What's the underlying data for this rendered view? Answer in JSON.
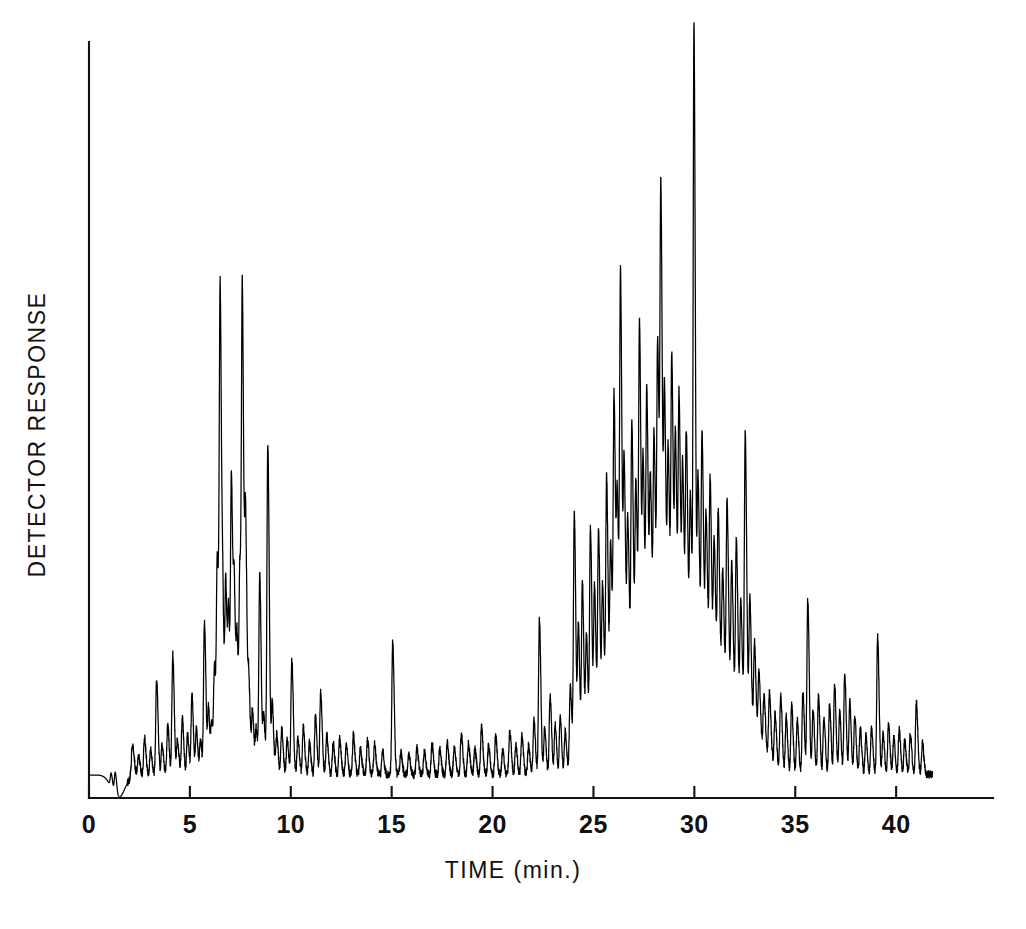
{
  "figure": {
    "background_color": "#ffffff",
    "ink_color": "#000000"
  },
  "axes": {
    "x_title": "TIME (min.)",
    "y_title": "DETECTOR  RESPONSE",
    "x_ticks": [
      "0",
      "5",
      "10",
      "15",
      "20",
      "25",
      "30",
      "35",
      "40"
    ]
  },
  "chart_data": {
    "type": "line",
    "title": "",
    "subtitle": "",
    "xlabel": "TIME (min.)",
    "ylabel": "DETECTOR RESPONSE",
    "xlim": [
      0,
      44.8
    ],
    "ylim": [
      0,
      1
    ],
    "xticks": [
      0,
      5,
      10,
      15,
      20,
      25,
      30,
      35,
      40
    ],
    "yticks": [],
    "grid": false,
    "legend": null,
    "annotations": [],
    "series": [
      {
        "name": "Total ion chromatogram",
        "color": "#000000",
        "baseline": 0.0,
        "x_start": 0.05,
        "x_end": 41.8,
        "solvent_dip": {
          "x": 1.45,
          "depth": -0.035,
          "width": 0.45
        },
        "broad_hump": {
          "x_start": 23.6,
          "x_peak": 29.0,
          "x_end": 34.6,
          "height": 0.175
        },
        "noise_amplitude": 0.006,
        "peaks": [
          {
            "t": 1.1,
            "h": 0.022,
            "w": 0.05
          },
          {
            "t": 1.3,
            "h": 0.035,
            "w": 0.05
          },
          {
            "t": 2.15,
            "h": 0.046,
            "w": 0.06
          },
          {
            "t": 2.45,
            "h": 0.03,
            "w": 0.05
          },
          {
            "t": 2.75,
            "h": 0.057,
            "w": 0.05
          },
          {
            "t": 3.05,
            "h": 0.038,
            "w": 0.05
          },
          {
            "t": 3.35,
            "h": 0.143,
            "w": 0.05
          },
          {
            "t": 3.62,
            "h": 0.044,
            "w": 0.05
          },
          {
            "t": 3.9,
            "h": 0.075,
            "w": 0.05
          },
          {
            "t": 4.15,
            "h": 0.182,
            "w": 0.05
          },
          {
            "t": 4.38,
            "h": 0.052,
            "w": 0.05
          },
          {
            "t": 4.62,
            "h": 0.086,
            "w": 0.05
          },
          {
            "t": 4.88,
            "h": 0.06,
            "w": 0.05
          },
          {
            "t": 5.1,
            "h": 0.12,
            "w": 0.05
          },
          {
            "t": 5.32,
            "h": 0.068,
            "w": 0.05
          },
          {
            "t": 5.52,
            "h": 0.052,
            "w": 0.05
          },
          {
            "t": 5.72,
            "h": 0.232,
            "w": 0.05
          },
          {
            "t": 5.92,
            "h": 0.098,
            "w": 0.05
          },
          {
            "t": 6.08,
            "h": 0.072,
            "w": 0.05
          },
          {
            "t": 6.22,
            "h": 0.155,
            "w": 0.05
          },
          {
            "t": 6.36,
            "h": 0.31,
            "w": 0.05
          },
          {
            "t": 6.5,
            "h": 0.7,
            "w": 0.05
          },
          {
            "t": 6.64,
            "h": 0.195,
            "w": 0.05
          },
          {
            "t": 6.78,
            "h": 0.27,
            "w": 0.05
          },
          {
            "t": 6.92,
            "h": 0.215,
            "w": 0.05
          },
          {
            "t": 7.06,
            "h": 0.425,
            "w": 0.05
          },
          {
            "t": 7.2,
            "h": 0.245,
            "w": 0.05
          },
          {
            "t": 7.34,
            "h": 0.18,
            "w": 0.05
          },
          {
            "t": 7.48,
            "h": 0.29,
            "w": 0.05
          },
          {
            "t": 7.6,
            "h": 0.675,
            "w": 0.05
          },
          {
            "t": 7.76,
            "h": 0.36,
            "w": 0.05
          },
          {
            "t": 7.92,
            "h": 0.13,
            "w": 0.05
          },
          {
            "t": 8.1,
            "h": 0.096,
            "w": 0.05
          },
          {
            "t": 8.28,
            "h": 0.068,
            "w": 0.05
          },
          {
            "t": 8.46,
            "h": 0.3,
            "w": 0.05
          },
          {
            "t": 8.66,
            "h": 0.084,
            "w": 0.05
          },
          {
            "t": 8.86,
            "h": 0.5,
            "w": 0.05
          },
          {
            "t": 9.08,
            "h": 0.105,
            "w": 0.05
          },
          {
            "t": 9.3,
            "h": 0.06,
            "w": 0.05
          },
          {
            "t": 9.55,
            "h": 0.07,
            "w": 0.05
          },
          {
            "t": 9.82,
            "h": 0.052,
            "w": 0.05
          },
          {
            "t": 10.05,
            "h": 0.175,
            "w": 0.05
          },
          {
            "t": 10.35,
            "h": 0.055,
            "w": 0.05
          },
          {
            "t": 10.62,
            "h": 0.072,
            "w": 0.05
          },
          {
            "t": 10.92,
            "h": 0.048,
            "w": 0.05
          },
          {
            "t": 11.22,
            "h": 0.088,
            "w": 0.05
          },
          {
            "t": 11.48,
            "h": 0.125,
            "w": 0.05
          },
          {
            "t": 11.78,
            "h": 0.06,
            "w": 0.05
          },
          {
            "t": 12.1,
            "h": 0.048,
            "w": 0.05
          },
          {
            "t": 12.42,
            "h": 0.055,
            "w": 0.05
          },
          {
            "t": 12.75,
            "h": 0.044,
            "w": 0.05
          },
          {
            "t": 13.1,
            "h": 0.06,
            "w": 0.05
          },
          {
            "t": 13.45,
            "h": 0.04,
            "w": 0.05
          },
          {
            "t": 13.8,
            "h": 0.052,
            "w": 0.05
          },
          {
            "t": 14.15,
            "h": 0.046,
            "w": 0.05
          },
          {
            "t": 14.55,
            "h": 0.036,
            "w": 0.05
          },
          {
            "t": 15.05,
            "h": 0.2,
            "w": 0.05
          },
          {
            "t": 15.45,
            "h": 0.034,
            "w": 0.05
          },
          {
            "t": 15.85,
            "h": 0.03,
            "w": 0.05
          },
          {
            "t": 16.25,
            "h": 0.04,
            "w": 0.05
          },
          {
            "t": 16.62,
            "h": 0.034,
            "w": 0.05
          },
          {
            "t": 17.0,
            "h": 0.046,
            "w": 0.05
          },
          {
            "t": 17.38,
            "h": 0.038,
            "w": 0.05
          },
          {
            "t": 17.75,
            "h": 0.05,
            "w": 0.05
          },
          {
            "t": 18.1,
            "h": 0.042,
            "w": 0.05
          },
          {
            "t": 18.45,
            "h": 0.062,
            "w": 0.05
          },
          {
            "t": 18.8,
            "h": 0.048,
            "w": 0.05
          },
          {
            "t": 19.12,
            "h": 0.038,
            "w": 0.05
          },
          {
            "t": 19.45,
            "h": 0.072,
            "w": 0.05
          },
          {
            "t": 19.8,
            "h": 0.044,
            "w": 0.05
          },
          {
            "t": 20.15,
            "h": 0.058,
            "w": 0.05
          },
          {
            "t": 20.5,
            "h": 0.036,
            "w": 0.05
          },
          {
            "t": 20.85,
            "h": 0.068,
            "w": 0.05
          },
          {
            "t": 21.15,
            "h": 0.046,
            "w": 0.05
          },
          {
            "t": 21.45,
            "h": 0.058,
            "w": 0.05
          },
          {
            "t": 21.78,
            "h": 0.044,
            "w": 0.05
          },
          {
            "t": 22.05,
            "h": 0.082,
            "w": 0.05
          },
          {
            "t": 22.32,
            "h": 0.235,
            "w": 0.05
          },
          {
            "t": 22.58,
            "h": 0.07,
            "w": 0.05
          },
          {
            "t": 22.85,
            "h": 0.12,
            "w": 0.05
          },
          {
            "t": 23.1,
            "h": 0.075,
            "w": 0.05
          },
          {
            "t": 23.35,
            "h": 0.088,
            "w": 0.05
          },
          {
            "t": 23.6,
            "h": 0.064,
            "w": 0.05
          },
          {
            "t": 23.85,
            "h": 0.13,
            "w": 0.05
          },
          {
            "t": 24.05,
            "h": 0.385,
            "w": 0.05
          },
          {
            "t": 24.25,
            "h": 0.205,
            "w": 0.05
          },
          {
            "t": 24.45,
            "h": 0.265,
            "w": 0.05
          },
          {
            "t": 24.65,
            "h": 0.175,
            "w": 0.05
          },
          {
            "t": 24.85,
            "h": 0.33,
            "w": 0.05
          },
          {
            "t": 25.05,
            "h": 0.23,
            "w": 0.05
          },
          {
            "t": 25.25,
            "h": 0.31,
            "w": 0.05
          },
          {
            "t": 25.45,
            "h": 0.215,
            "w": 0.05
          },
          {
            "t": 25.65,
            "h": 0.37,
            "w": 0.05
          },
          {
            "t": 25.85,
            "h": 0.26,
            "w": 0.05
          },
          {
            "t": 26.02,
            "h": 0.47,
            "w": 0.05
          },
          {
            "t": 26.18,
            "h": 0.295,
            "w": 0.05
          },
          {
            "t": 26.34,
            "h": 0.63,
            "w": 0.05
          },
          {
            "t": 26.52,
            "h": 0.34,
            "w": 0.05
          },
          {
            "t": 26.7,
            "h": 0.255,
            "w": 0.05
          },
          {
            "t": 26.9,
            "h": 0.4,
            "w": 0.05
          },
          {
            "t": 27.1,
            "h": 0.3,
            "w": 0.05
          },
          {
            "t": 27.28,
            "h": 0.53,
            "w": 0.05
          },
          {
            "t": 27.46,
            "h": 0.315,
            "w": 0.05
          },
          {
            "t": 27.64,
            "h": 0.42,
            "w": 0.05
          },
          {
            "t": 27.82,
            "h": 0.28,
            "w": 0.05
          },
          {
            "t": 28.0,
            "h": 0.345,
            "w": 0.05
          },
          {
            "t": 28.18,
            "h": 0.48,
            "w": 0.05
          },
          {
            "t": 28.34,
            "h": 0.69,
            "w": 0.05
          },
          {
            "t": 28.52,
            "h": 0.395,
            "w": 0.05
          },
          {
            "t": 28.7,
            "h": 0.31,
            "w": 0.05
          },
          {
            "t": 28.88,
            "h": 0.45,
            "w": 0.05
          },
          {
            "t": 29.06,
            "h": 0.33,
            "w": 0.05
          },
          {
            "t": 29.24,
            "h": 0.395,
            "w": 0.05
          },
          {
            "t": 29.42,
            "h": 0.285,
            "w": 0.05
          },
          {
            "t": 29.6,
            "h": 0.34,
            "w": 0.05
          },
          {
            "t": 29.8,
            "h": 0.25,
            "w": 0.05
          },
          {
            "t": 29.98,
            "h": 0.96,
            "w": 0.045
          },
          {
            "t": 30.18,
            "h": 0.285,
            "w": 0.05
          },
          {
            "t": 30.38,
            "h": 0.36,
            "w": 0.05
          },
          {
            "t": 30.58,
            "h": 0.24,
            "w": 0.05
          },
          {
            "t": 30.78,
            "h": 0.3,
            "w": 0.05
          },
          {
            "t": 30.98,
            "h": 0.215,
            "w": 0.05
          },
          {
            "t": 31.18,
            "h": 0.265,
            "w": 0.05
          },
          {
            "t": 31.4,
            "h": 0.185,
            "w": 0.05
          },
          {
            "t": 31.62,
            "h": 0.3,
            "w": 0.05
          },
          {
            "t": 31.85,
            "h": 0.215,
            "w": 0.05
          },
          {
            "t": 32.08,
            "h": 0.26,
            "w": 0.05
          },
          {
            "t": 32.3,
            "h": 0.175,
            "w": 0.05
          },
          {
            "t": 32.52,
            "h": 0.44,
            "w": 0.05
          },
          {
            "t": 32.75,
            "h": 0.2,
            "w": 0.05
          },
          {
            "t": 32.98,
            "h": 0.145,
            "w": 0.05
          },
          {
            "t": 33.2,
            "h": 0.11,
            "w": 0.05
          },
          {
            "t": 33.45,
            "h": 0.085,
            "w": 0.05
          },
          {
            "t": 33.72,
            "h": 0.1,
            "w": 0.05
          },
          {
            "t": 34.0,
            "h": 0.078,
            "w": 0.05
          },
          {
            "t": 34.28,
            "h": 0.115,
            "w": 0.05
          },
          {
            "t": 34.55,
            "h": 0.088,
            "w": 0.05
          },
          {
            "t": 34.82,
            "h": 0.105,
            "w": 0.05
          },
          {
            "t": 35.1,
            "h": 0.082,
            "w": 0.05
          },
          {
            "t": 35.38,
            "h": 0.125,
            "w": 0.05
          },
          {
            "t": 35.62,
            "h": 0.265,
            "w": 0.05
          },
          {
            "t": 35.88,
            "h": 0.098,
            "w": 0.05
          },
          {
            "t": 36.15,
            "h": 0.118,
            "w": 0.05
          },
          {
            "t": 36.42,
            "h": 0.085,
            "w": 0.05
          },
          {
            "t": 36.7,
            "h": 0.105,
            "w": 0.05
          },
          {
            "t": 36.95,
            "h": 0.135,
            "w": 0.05
          },
          {
            "t": 37.2,
            "h": 0.095,
            "w": 0.05
          },
          {
            "t": 37.45,
            "h": 0.155,
            "w": 0.05
          },
          {
            "t": 37.7,
            "h": 0.11,
            "w": 0.05
          },
          {
            "t": 37.95,
            "h": 0.088,
            "w": 0.05
          },
          {
            "t": 38.22,
            "h": 0.07,
            "w": 0.05
          },
          {
            "t": 38.5,
            "h": 0.058,
            "w": 0.05
          },
          {
            "t": 38.78,
            "h": 0.072,
            "w": 0.05
          },
          {
            "t": 39.08,
            "h": 0.21,
            "w": 0.05
          },
          {
            "t": 39.35,
            "h": 0.062,
            "w": 0.05
          },
          {
            "t": 39.62,
            "h": 0.075,
            "w": 0.05
          },
          {
            "t": 39.88,
            "h": 0.055,
            "w": 0.05
          },
          {
            "t": 40.15,
            "h": 0.068,
            "w": 0.05
          },
          {
            "t": 40.42,
            "h": 0.05,
            "w": 0.05
          },
          {
            "t": 40.7,
            "h": 0.062,
            "w": 0.05
          },
          {
            "t": 41.0,
            "h": 0.11,
            "w": 0.05
          },
          {
            "t": 41.3,
            "h": 0.048,
            "w": 0.05
          }
        ]
      }
    ]
  }
}
